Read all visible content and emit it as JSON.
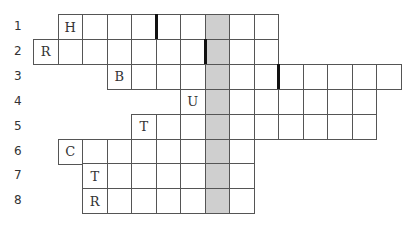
{
  "puzzle": {
    "type": "crossword-keyword",
    "shaded_column_index": 7,
    "shaded_color": "#cfcfcf",
    "rows": [
      {
        "number": "1",
        "start_col": 1,
        "end_col": 9,
        "letters": {
          "1": "H"
        },
        "bar_before_col": 5
      },
      {
        "number": "2",
        "start_col": 0,
        "end_col": 9,
        "letters": {
          "0": "R"
        },
        "bar_before_col": 7
      },
      {
        "number": "3",
        "start_col": 3,
        "end_col": 14,
        "letters": {
          "3": "B"
        },
        "bar_before_col": 10
      },
      {
        "number": "4",
        "start_col": 6,
        "end_col": 13,
        "letters": {
          "6": "U"
        },
        "bar_before_col": null
      },
      {
        "number": "5",
        "start_col": 4,
        "end_col": 13,
        "letters": {
          "4": "T"
        },
        "bar_before_col": null
      },
      {
        "number": "6",
        "start_col": 1,
        "end_col": 8,
        "letters": {
          "1": "C"
        },
        "bar_before_col": null
      },
      {
        "number": "7",
        "start_col": 2,
        "end_col": 8,
        "letters": {
          "2": "T"
        },
        "bar_before_col": null
      },
      {
        "number": "8",
        "start_col": 2,
        "end_col": 8,
        "letters": {
          "2": "R"
        },
        "bar_before_col": null
      }
    ]
  }
}
